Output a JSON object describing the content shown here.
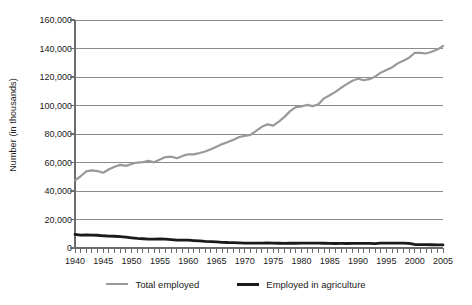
{
  "chart_data": {
    "type": "line",
    "title": "",
    "xlabel": "",
    "ylabel": "Number (in thousands)",
    "xlim": [
      1940,
      2005
    ],
    "ylim": [
      0,
      160000
    ],
    "grid": true,
    "legend_position": "bottom",
    "y_ticks": [
      0,
      20000,
      40000,
      60000,
      80000,
      100000,
      120000,
      140000,
      160000
    ],
    "y_tick_labels": [
      "0",
      "20,000",
      "40,000",
      "60,000",
      "80,000",
      "100,000",
      "120,000",
      "140,000",
      "160,000"
    ],
    "x_ticks": [
      1940,
      1945,
      1950,
      1955,
      1960,
      1965,
      1970,
      1975,
      1980,
      1985,
      1990,
      1995,
      2000,
      2005
    ],
    "x_tick_labels": [
      "1940",
      "1945",
      "1950",
      "1955",
      "1960",
      "1965",
      "1970",
      "1975",
      "1980",
      "1985",
      "1990",
      "1995",
      "2000",
      "2005"
    ],
    "x": [
      1940,
      1941,
      1942,
      1943,
      1944,
      1945,
      1946,
      1947,
      1948,
      1949,
      1950,
      1951,
      1952,
      1953,
      1954,
      1955,
      1956,
      1957,
      1958,
      1959,
      1960,
      1961,
      1962,
      1963,
      1964,
      1965,
      1966,
      1967,
      1968,
      1969,
      1970,
      1971,
      1972,
      1973,
      1974,
      1975,
      1976,
      1977,
      1978,
      1979,
      1980,
      1981,
      1982,
      1983,
      1984,
      1985,
      1986,
      1987,
      1988,
      1989,
      1990,
      1991,
      1992,
      1993,
      1994,
      1995,
      1996,
      1997,
      1998,
      1999,
      2000,
      2001,
      2002,
      2003,
      2004,
      2005
    ],
    "series": [
      {
        "name": "Total employed",
        "color": "#999999",
        "width": 2.2,
        "values": [
          47520,
          50350,
          53750,
          54470,
          53960,
          52820,
          55250,
          57040,
          58340,
          57640,
          58920,
          59960,
          60250,
          61180,
          60110,
          62170,
          63800,
          64070,
          63040,
          64630,
          65780,
          65750,
          66700,
          67760,
          69310,
          71090,
          72900,
          74370,
          75920,
          77900,
          78680,
          79370,
          82150,
          85060,
          86790,
          85850,
          88750,
          92020,
          96050,
          98820,
          99300,
          100400,
          99530,
          100830,
          105010,
          107150,
          109600,
          112440,
          114970,
          117340,
          118790,
          117720,
          118490,
          120260,
          123060,
          124900,
          126710,
          129560,
          131460,
          133490,
          136890,
          136930,
          136490,
          137740,
          139250,
          141730
        ]
      },
      {
        "name": "Employed in agriculture",
        "color": "#1a1a1a",
        "width": 2.8,
        "values": [
          9540,
          9100,
          9250,
          9080,
          8950,
          8580,
          8320,
          8260,
          7973,
          7658,
          7160,
          6726,
          6500,
          6260,
          6205,
          6450,
          6283,
          5947,
          5586,
          5565,
          5458,
          5200,
          4944,
          4687,
          4523,
          4361,
          3979,
          3844,
          3817,
          3606,
          3463,
          3394,
          3484,
          3470,
          3515,
          3408,
          3331,
          3283,
          3387,
          3347,
          3364,
          3368,
          3401,
          3383,
          3321,
          3179,
          3163,
          3208,
          3169,
          3199,
          3223,
          3269,
          3247,
          3115,
          3409,
          3440,
          3443,
          3399,
          3378,
          3281,
          2464,
          2299,
          2311,
          2275,
          2232,
          2197
        ]
      }
    ]
  },
  "legend": {
    "items": [
      {
        "label": "Total employed",
        "color": "#999999",
        "width": 2.2
      },
      {
        "label": "Employed in agriculture",
        "color": "#1a1a1a",
        "width": 3.0
      }
    ]
  },
  "axes": {
    "axis_color": "#6b6b6b",
    "grid_color": "#8c8c8c",
    "background": "#ffffff"
  }
}
